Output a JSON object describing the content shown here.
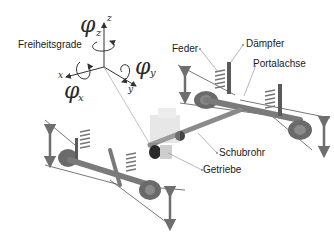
{
  "diagram": {
    "type": "technical-illustration",
    "dof_title": "Freiheitsgrade",
    "axes": {
      "x": "x",
      "y": "y",
      "z": "z"
    },
    "rotations": [
      {
        "symbol": "φ",
        "subscript": "z"
      },
      {
        "symbol": "φ",
        "subscript": "x"
      },
      {
        "symbol": "φ",
        "subscript": "y"
      }
    ],
    "labels": {
      "feder": "Feder",
      "daempfer": "Dämpfer",
      "portalachse": "Portalachse",
      "schubrohr": "Schubrohr",
      "getriebe": "Getriebe"
    },
    "colors": {
      "background": "#ffffff",
      "text": "#1a1a1a",
      "part_gray": "#7a7a7a",
      "part_dark": "#4a4a4a",
      "leader_line": "#888888",
      "arrow": "#6e6e6e"
    }
  }
}
